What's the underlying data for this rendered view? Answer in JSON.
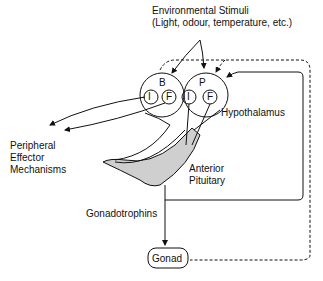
{
  "diagram": {
    "stimuli_title": "Environmental Stimuli",
    "stimuli_sub": "(Light, odour, temperature, etc.)",
    "node_B": "B",
    "node_P": "P",
    "node_I1": "I",
    "node_F1": "F",
    "node_I2": "I",
    "node_F2": "F",
    "hypothalamus": "Hypothalamus",
    "peripheral_1": "Peripheral",
    "peripheral_2": "Effector",
    "peripheral_3": "Mechanisms",
    "anterior_1": "Anterior",
    "anterior_2": "Pituitary",
    "gonadotrophins": "Gonadotrophins",
    "gonad": "Gonad"
  }
}
